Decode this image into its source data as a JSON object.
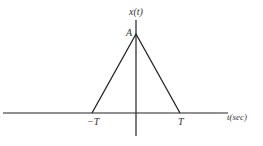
{
  "diagram": {
    "y_axis_label": "x(t)",
    "x_axis_label": "t(sec)",
    "peak_label": "A",
    "left_tick_label": "−T",
    "right_tick_label": "T",
    "line_color": "#222222"
  }
}
